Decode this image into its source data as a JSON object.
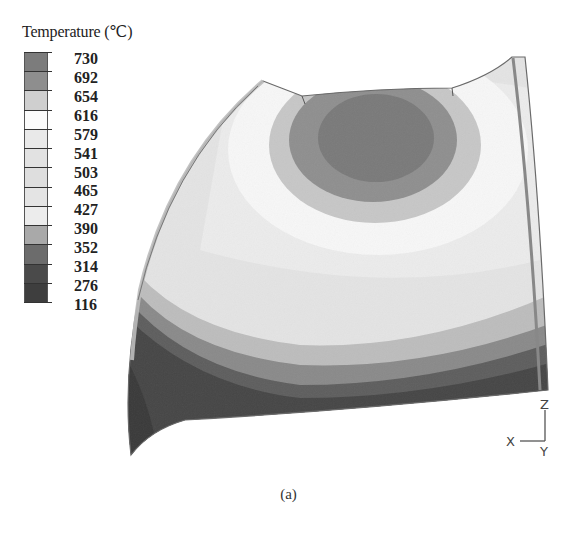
{
  "chart_data": {
    "type": "heatmap",
    "subtype": "3d-contour-plot",
    "title": "",
    "legend": {
      "title": "Temperature (℃)",
      "levels": [
        730,
        692,
        654,
        616,
        579,
        541,
        503,
        465,
        427,
        390,
        352,
        314,
        276,
        116
      ],
      "band_colors": [
        "#7c7c7c",
        "#8e8e8e",
        "#cfcfcf",
        "#fbfbfb",
        "#e9e9e9",
        "#e2e2e2",
        "#dedede",
        "#e4e4e4",
        "#ececec",
        "#a9a9a9",
        "#6c6c6c",
        "#4a4a4a",
        "#3e3e3e"
      ],
      "position": "top-left"
    },
    "regions": [
      {
        "name": "hot-core",
        "approx_range": [
          654,
          730
        ],
        "location": "top-center ellipse"
      },
      {
        "name": "hot-ring",
        "approx_range": [
          616,
          654
        ],
        "location": "ring around core"
      },
      {
        "name": "mid-body",
        "approx_range": [
          390,
          616
        ],
        "location": "central body"
      },
      {
        "name": "cool-band",
        "approx_range": [
          314,
          390
        ],
        "location": "lower band"
      },
      {
        "name": "cold-base",
        "approx_range": [
          116,
          314
        ],
        "location": "bottom edge and left flange"
      }
    ],
    "axes_triad": {
      "x": "X",
      "y": "Y",
      "z": "Z"
    },
    "grid": false
  },
  "figure": {
    "caption": "(a)"
  }
}
